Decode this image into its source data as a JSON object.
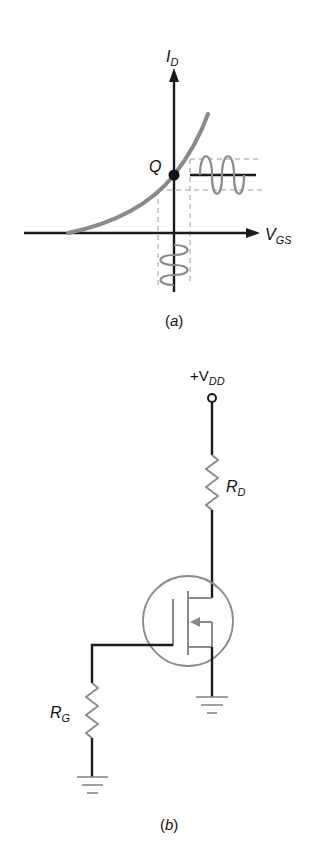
{
  "figure_a": {
    "caption_open": "(",
    "caption_letter": "a",
    "caption_close": ")",
    "y_axis_label": "I",
    "y_axis_label_sub": "D",
    "x_axis_label": "V",
    "x_axis_label_sub": "GS",
    "q_point_label": "Q",
    "curve_color": "#8a8a8a",
    "axis_color": "#1a1a1a",
    "dashed_color": "#9a9a9a"
  },
  "figure_b": {
    "caption_open": "(",
    "caption_letter": "b",
    "caption_close": ")",
    "supply_label": "+V",
    "supply_label_sub": "DD",
    "drain_resistor_label": "R",
    "drain_resistor_label_sub": "D",
    "gate_resistor_label": "R",
    "gate_resistor_label_sub": "G",
    "wire_color": "#1a1a1a",
    "component_color": "#8a8a8a"
  }
}
